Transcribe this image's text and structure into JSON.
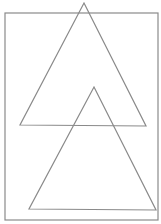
{
  "diagram": {
    "width": 161,
    "height": 224,
    "stroke_color": "#8a8a8a",
    "background": "#ffffff",
    "shapes": [
      {
        "kind": "rectangle",
        "name": "frame",
        "x": 5,
        "y": 13,
        "w": 153,
        "h": 207
      },
      {
        "kind": "triangle",
        "name": "upper-triangle",
        "points": [
          [
            84,
            3
          ],
          [
            146,
            126
          ],
          [
            20,
            125
          ]
        ]
      },
      {
        "kind": "triangle",
        "name": "lower-triangle",
        "points": [
          [
            94,
            87
          ],
          [
            156,
            210
          ],
          [
            29,
            209
          ]
        ]
      }
    ]
  }
}
